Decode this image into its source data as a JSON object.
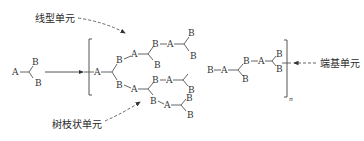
{
  "diagram": {
    "type": "hyperbranched-polymer-schematic",
    "monomer": {
      "formula_label": "AB2",
      "atoms": [
        "A",
        "B",
        "B"
      ]
    },
    "reaction_arrow": "monomer-to-polymer",
    "polymer_subscript": "n",
    "annotations": {
      "linear_unit": "线型单元",
      "dendritic_unit": "树枝状单元",
      "terminal_unit": "端基单元"
    },
    "atom_labels": {
      "A": "A",
      "B": "B"
    },
    "colors": {
      "line": "#555555",
      "text": "#333333",
      "background": "#ffffff"
    }
  }
}
